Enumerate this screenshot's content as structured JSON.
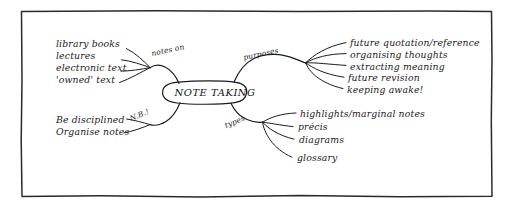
{
  "diagram": {
    "title": "NOTE TAKING",
    "center_node": "NOTE TAKING",
    "branches": [
      {
        "label": "notes on",
        "position": "upper-left",
        "items": [
          "library books",
          "lectures",
          "electronic text",
          "'owned' text"
        ]
      },
      {
        "label": "N.B.!",
        "position": "lower-left",
        "items": [
          "Be disciplined",
          "Organise notes"
        ]
      },
      {
        "label": "purposes",
        "position": "upper-right",
        "items": [
          "future quotation/reference",
          "organising thoughts",
          "extracting meaning",
          "future revision",
          "keeping awake!"
        ]
      },
      {
        "label": "types",
        "position": "lower-right",
        "items": [
          "highlights/marginal notes",
          "précis",
          "diagrams",
          "glossary"
        ]
      }
    ]
  },
  "colors": {
    "ink": "#1c1c1c",
    "paper": "#ffffff",
    "frame": "#2a2a2a"
  }
}
